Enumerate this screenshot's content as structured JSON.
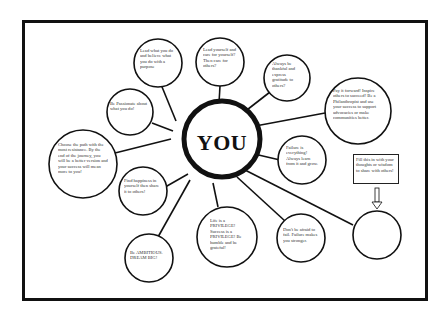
{
  "diagram": {
    "center": {
      "label": "YOU"
    },
    "bubbles": [
      {
        "id": "b1",
        "text": "Lead what you do and believe what you do with a purpose"
      },
      {
        "id": "b2",
        "text": "Lead yourself and care for yourself? Then care for others?"
      },
      {
        "id": "b3",
        "text": "Always be thankful and express gratitude to others?"
      },
      {
        "id": "b4",
        "text": "Pay it forward! Inspire others to succeed! Be a Philanthropist and use your success to support advocacies or make communities better."
      },
      {
        "id": "b5",
        "text": "Be Passionate about what you do!"
      },
      {
        "id": "b6",
        "text": "Choose the path with the most resistance. By the end of the journey, you will be a better version and your success will mean more to you!"
      },
      {
        "id": "b7",
        "text": "Failure is everything! Always learn from it and grow."
      },
      {
        "id": "b8",
        "text": "Find happiness in yourself then share it to others!"
      },
      {
        "id": "b9",
        "text": "Be AMBITIOUS. DREAM BIG!"
      },
      {
        "id": "b10",
        "text": "Life is a PRIVILEGE! Success is a PRIVILEGE! Be humble and be grateful!"
      },
      {
        "id": "b11",
        "text": "Don't be afraid to fail. Failure makes you stronger."
      },
      {
        "id": "b12",
        "text": ""
      }
    ],
    "note_box": {
      "text": "Fill this in with your thoughts or wisdom to share with others!"
    },
    "transcription_note": "Bubble text was blurred in the source image and is a best-effort reading, not an exact transcription."
  }
}
